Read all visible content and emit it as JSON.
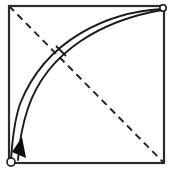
{
  "figure": {
    "background_color": "#ffffff",
    "stroke_color": "#1a1a1a",
    "canvas": {
      "width": 174,
      "height": 172
    }
  },
  "square": {
    "name": "bounding-square",
    "x": 9,
    "y": 6,
    "width": 155,
    "height": 157,
    "stroke_color": "#2b2b2b",
    "stroke_width": 2.2,
    "fill": "none"
  },
  "diagonal": {
    "name": "dashed-diagonal",
    "from": {
      "x": 9,
      "y": 6
    },
    "to": {
      "x": 164,
      "y": 163
    },
    "stroke_color": "#262626",
    "stroke_width": 2.0,
    "dash_pattern": "7 5",
    "style": "dashed"
  },
  "curves": [
    {
      "name": "outer-arc",
      "label": "outer curve",
      "path": "M 162 9 C 110 12 46 38 20 104 C 14 122 12 144 11 160",
      "stroke_color": "#1a1a1a",
      "stroke_width": 1.9,
      "fill": "none"
    },
    {
      "name": "inner-arc",
      "label": "inner curve",
      "path": "M 162 10 C 104 20 48 50 28 108 C 22 126 19 146 18 160",
      "stroke_color": "#1a1a1a",
      "stroke_width": 1.9,
      "fill": "none"
    }
  ],
  "tick_mark": {
    "name": "perpendicular-tick",
    "from": {
      "x": 56,
      "y": 46
    },
    "to": {
      "x": 66,
      "y": 56
    },
    "stroke_color": "#1a1a1a",
    "stroke_width": 1.8
  },
  "arrow_head": {
    "name": "direction-arrowhead",
    "points": "22,137 26,158 12,152",
    "fill_color": "#0d0d0d",
    "direction": "down-left"
  },
  "markers": [
    {
      "name": "start-point-marker",
      "position": "top-right",
      "cx": 163,
      "cy": 8,
      "r": 3.2,
      "fill": "#ffffff",
      "stroke_color": "#1a1a1a",
      "stroke_width": 1.6
    },
    {
      "name": "end-point-marker",
      "position": "bottom-left",
      "cx": 11,
      "cy": 162,
      "r": 4.0,
      "fill": "#ffffff",
      "stroke_color": "#1a1a1a",
      "stroke_width": 1.6
    }
  ]
}
